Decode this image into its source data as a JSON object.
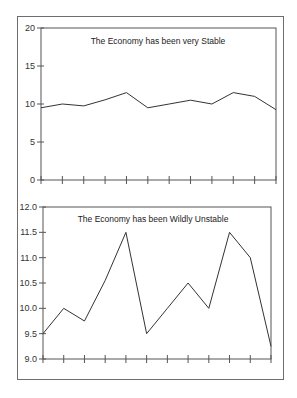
{
  "chart_data": [
    {
      "type": "line",
      "title": "The Economy has been very Stable",
      "xlabel": "",
      "ylabel": "",
      "ylim": [
        0,
        20
      ],
      "yticks": [
        "0",
        "5",
        "10",
        "15",
        "20"
      ],
      "ytick_values": [
        0,
        5,
        10,
        15,
        20
      ],
      "x": [
        1,
        2,
        3,
        4,
        5,
        6,
        7,
        8,
        9,
        10,
        11,
        12
      ],
      "values": [
        9.5,
        10.0,
        9.75,
        10.55,
        11.5,
        9.5,
        10.0,
        10.5,
        10.0,
        11.5,
        11.0,
        9.25
      ],
      "grid": false,
      "legend": null
    },
    {
      "type": "line",
      "title": "The Economy has been Wildly Unstable",
      "xlabel": "",
      "ylabel": "",
      "ylim": [
        9.0,
        12.0
      ],
      "yticks": [
        "9.0",
        "9.5",
        "10.0",
        "10.5",
        "11.0",
        "11.5",
        "12.0"
      ],
      "ytick_values": [
        9.0,
        9.5,
        10.0,
        10.5,
        11.0,
        11.5,
        12.0
      ],
      "x": [
        1,
        2,
        3,
        4,
        5,
        6,
        7,
        8,
        9,
        10,
        11,
        12
      ],
      "values": [
        9.5,
        10.0,
        9.75,
        10.55,
        11.5,
        9.5,
        10.0,
        10.5,
        10.0,
        11.5,
        11.0,
        9.25
      ],
      "grid": false,
      "legend": null
    }
  ],
  "layout": [
    {
      "left": 41,
      "right": 276,
      "top": 28,
      "bottom": 180,
      "title_x": 158,
      "title_y": 44
    },
    {
      "left": 43,
      "right": 271,
      "top": 207,
      "bottom": 359,
      "title_x": 153,
      "title_y": 222
    }
  ],
  "colors": {
    "line": "#333333",
    "axis": "#555555",
    "frame": "#6e6e6e"
  }
}
